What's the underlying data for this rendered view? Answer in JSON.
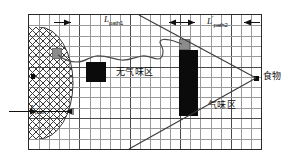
{
  "figure": {
    "title": "",
    "type": "schematic-diagram",
    "background_color": "#ffffff",
    "grid": {
      "columns": 23,
      "rows": 13,
      "minor_color": "#9a9a9a",
      "major_color": "#4a4a4a",
      "major_every": 5,
      "border_color": "#2a2a2a"
    }
  },
  "labels": {
    "path_left": {
      "L": "L",
      "sub": "path",
      "prime": ""
    },
    "path1": {
      "L": "L",
      "sub": "path1",
      "prime": ""
    },
    "path2": {
      "L": "L",
      "sub": "path2",
      "prime": "′"
    },
    "no_odor_zone": "无气味区",
    "odor_zone": "气味区",
    "food": "食物"
  },
  "elements": {
    "nest_region": {
      "name": "hatched-half-ellipse",
      "fill": "cross-hatch",
      "stroke_color": "#3a3a3a"
    },
    "start_marker": {
      "name": "gray-square",
      "color": "#8c8c8c"
    },
    "nest_marker": {
      "name": "black-dot",
      "color": "#0b0b0b"
    },
    "obstacle_small": {
      "name": "black-rectangle",
      "color": "#0b0b0b"
    },
    "obstacle_tall": {
      "name": "black-rectangle",
      "color": "#0b0b0b"
    },
    "corner_marker": {
      "name": "gray-square",
      "color": "#8c8c8c"
    },
    "food_marker": {
      "name": "black-square",
      "color": "#0b0b0b"
    },
    "wander_path": {
      "name": "wavy-polyline",
      "color": "#4a4a4a"
    },
    "odor_cone": {
      "name": "two-diagonal-lines",
      "color": "#3a3a3a"
    }
  },
  "chart_data": {
    "type": "diagram",
    "title": "",
    "xlabel": "",
    "ylabel": "",
    "grid": true,
    "annotations": [
      {
        "text": "L_path",
        "position": "bottom-left-inside-nest"
      },
      {
        "text": "L_path1",
        "position": "top-center-left"
      },
      {
        "text": "L'_path2",
        "position": "top-right"
      },
      {
        "text": "无气味区",
        "position": "center-left"
      },
      {
        "text": "气味区",
        "position": "center-right"
      },
      {
        "text": "食物",
        "position": "right-outside"
      }
    ]
  }
}
